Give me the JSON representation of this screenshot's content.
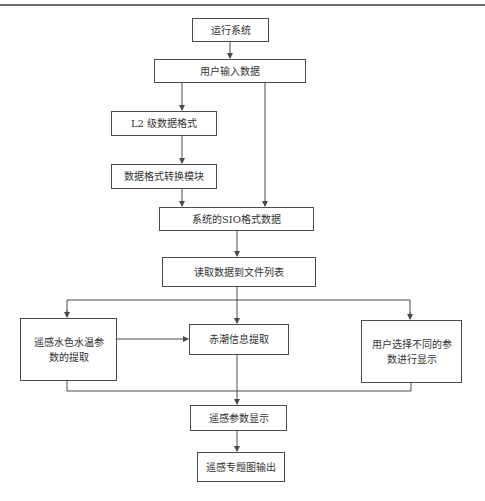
{
  "diagram": {
    "type": "flowchart",
    "nodes": [
      {
        "id": "run_system",
        "label": "运行系统"
      },
      {
        "id": "user_input",
        "label": "用户输入数据"
      },
      {
        "id": "l2_format",
        "label": "L2 级数据格式"
      },
      {
        "id": "format_convert",
        "label": "数据格式转换模块"
      },
      {
        "id": "sio_format",
        "label": "系统的SIO格式数据"
      },
      {
        "id": "read_to_list",
        "label": "读取数据到文件列表"
      },
      {
        "id": "ocean_param_extract",
        "label": "遥感水色水温参数的提取"
      },
      {
        "id": "red_tide_extract",
        "label": "赤潮信息提取"
      },
      {
        "id": "user_select_display",
        "label": "用户选择不同的参数进行显示"
      },
      {
        "id": "param_display",
        "label": "遥感参数显示"
      },
      {
        "id": "thematic_output",
        "label": "遥感专题图输出"
      }
    ],
    "edges": [
      {
        "from": "run_system",
        "to": "user_input"
      },
      {
        "from": "user_input",
        "to": "l2_format"
      },
      {
        "from": "user_input",
        "to": "sio_format"
      },
      {
        "from": "l2_format",
        "to": "format_convert"
      },
      {
        "from": "format_convert",
        "to": "sio_format"
      },
      {
        "from": "sio_format",
        "to": "read_to_list"
      },
      {
        "from": "read_to_list",
        "to": "ocean_param_extract"
      },
      {
        "from": "read_to_list",
        "to": "red_tide_extract"
      },
      {
        "from": "read_to_list",
        "to": "user_select_display"
      },
      {
        "from": "ocean_param_extract",
        "to": "red_tide_extract"
      },
      {
        "from": "ocean_param_extract",
        "to": "param_display"
      },
      {
        "from": "red_tide_extract",
        "to": "param_display"
      },
      {
        "from": "user_select_display",
        "to": "param_display"
      },
      {
        "from": "param_display",
        "to": "thematic_output"
      }
    ]
  },
  "labels": {
    "run_system": "运行系统",
    "user_input": "用户输入数据",
    "l2_format": "L2 级数据格式",
    "format_convert": "数据格式转换模块",
    "sio_format": "系统的SIO格式数据",
    "read_to_list": "读取数据到文件列表",
    "ocean_param_extract": "遥感水色水温参数的提取",
    "red_tide_extract": "赤潮信息提取",
    "user_select_display": "用户选择不同的参数进行显示",
    "param_display": "遥感参数显示",
    "thematic_output": "遥感专题图输出"
  },
  "colors": {
    "line": "#4a4a4a",
    "background": "#ffffff",
    "text": "#333333"
  }
}
